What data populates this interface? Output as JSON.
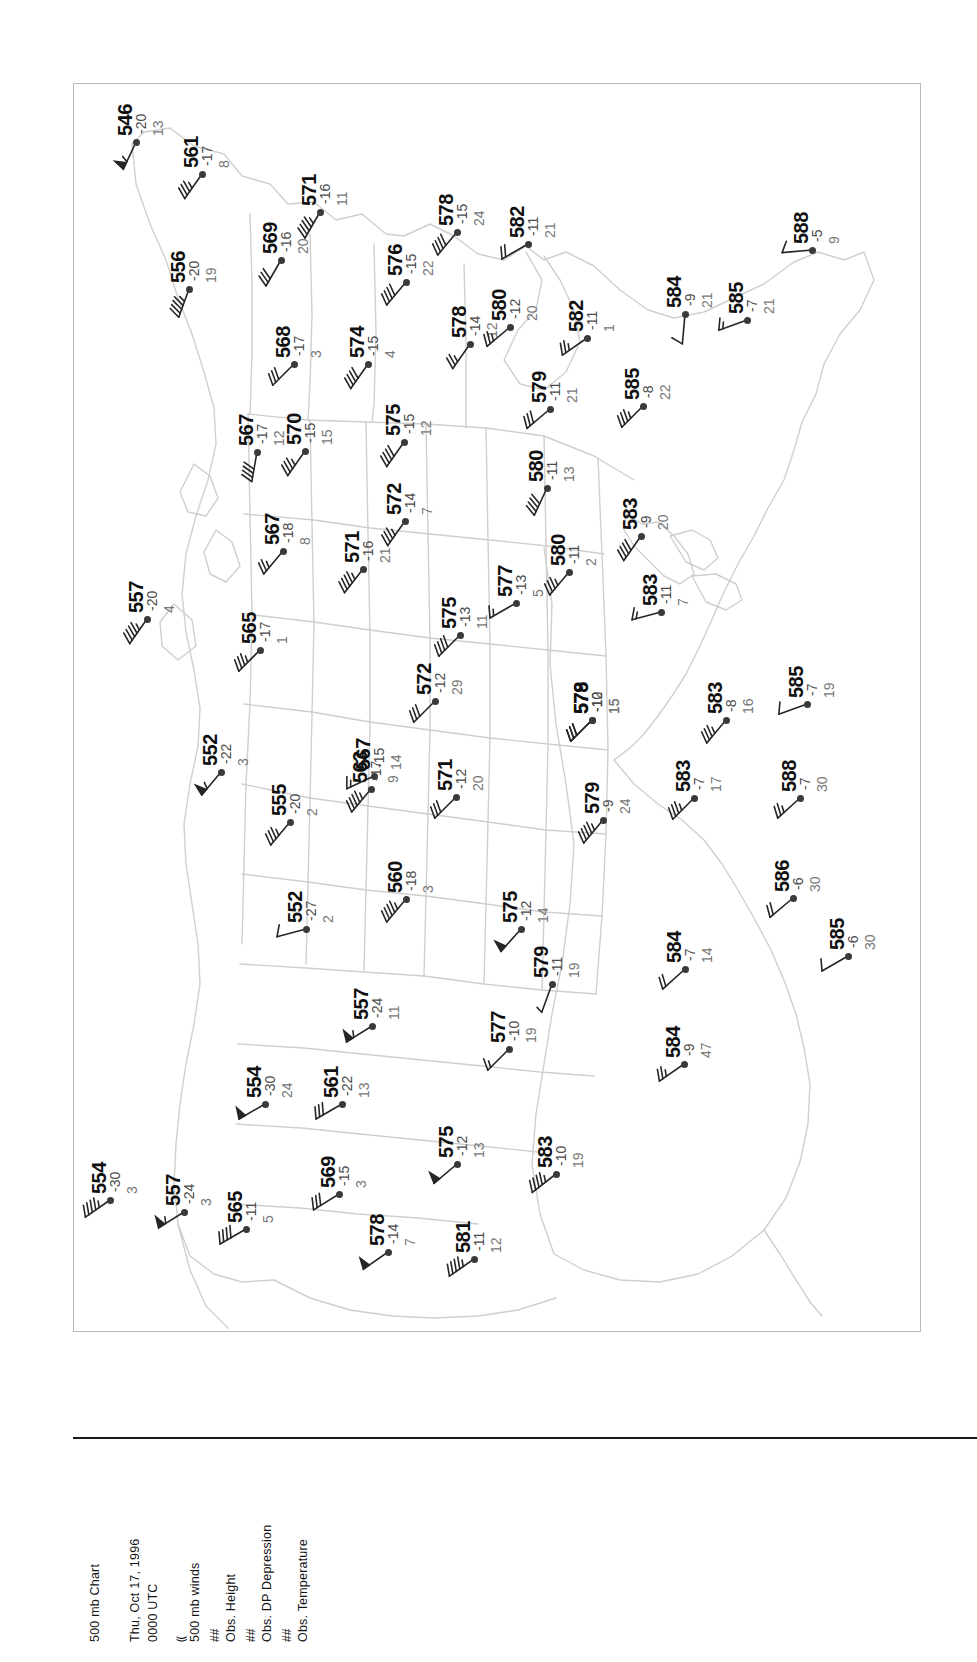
{
  "document": {
    "title_line_1": "500 mb Chart",
    "date_line": "Thu, Oct 17, 1996",
    "time_line": "0000 UTC"
  },
  "legend": {
    "wind_symbol": "⸨",
    "wind_label": "500 mb winds",
    "height_symbol": "##",
    "height_label": "Obs. Height",
    "dpd_symbol": "##",
    "dpd_label": "Obs. DP Depression",
    "temp_symbol": "##",
    "temp_label": "Obs. Temperature"
  },
  "chart_data": {
    "type": "scatter",
    "title": "500 mb Chart",
    "subtitle": "Thu, Oct 17, 1996 0000 UTC",
    "xlabel": "",
    "ylabel": "",
    "grid": false,
    "legend_position": "bottom-left",
    "projection_note": "North America, map rotated 90 degrees clockwise on page",
    "fields": [
      "height_dam",
      "temperature_C",
      "dewpoint_depression_C",
      "wind_barb_deg",
      "wind_speed_kt"
    ],
    "stations": [
      {
        "height": "546",
        "temp": "-20",
        "dpd": "13",
        "x": 62,
        "y": 58,
        "barb_rot": 205,
        "barb_kt": 55
      },
      {
        "height": "561",
        "temp": "-17",
        "dpd": "8",
        "x": 128,
        "y": 90,
        "barb_rot": 215,
        "barb_kt": 35
      },
      {
        "height": "569",
        "temp": "-16",
        "dpd": "20",
        "x": 207,
        "y": 176,
        "barb_rot": 210,
        "barb_kt": 30
      },
      {
        "height": "571",
        "temp": "-16",
        "dpd": "11",
        "x": 246,
        "y": 128,
        "barb_rot": 210,
        "barb_kt": 45
      },
      {
        "height": "556",
        "temp": "-20",
        "dpd": "19",
        "x": 115,
        "y": 205,
        "barb_rot": 200,
        "barb_kt": 45
      },
      {
        "height": "568",
        "temp": "-17",
        "dpd": "3",
        "x": 220,
        "y": 280,
        "barb_rot": 225,
        "barb_kt": 30
      },
      {
        "height": "574",
        "temp": "-15",
        "dpd": "4",
        "x": 294,
        "y": 280,
        "barb_rot": 215,
        "barb_kt": 40
      },
      {
        "height": "576",
        "temp": "-15",
        "dpd": "22",
        "x": 332,
        "y": 198,
        "barb_rot": 220,
        "barb_kt": 40
      },
      {
        "height": "578",
        "temp": "-15",
        "dpd": "24",
        "x": 383,
        "y": 148,
        "barb_rot": 220,
        "barb_kt": 40
      },
      {
        "height": "582",
        "temp": "-11",
        "dpd": "21",
        "x": 454,
        "y": 160,
        "barb_rot": 240,
        "barb_kt": 20
      },
      {
        "height": "578",
        "temp": "-14",
        "dpd": "12",
        "x": 396,
        "y": 260,
        "barb_rot": 215,
        "barb_kt": 25
      },
      {
        "height": "580",
        "temp": "-12",
        "dpd": "20",
        "x": 436,
        "y": 243,
        "barb_rot": 230,
        "barb_kt": 25
      },
      {
        "height": "582",
        "temp": "-11",
        "dpd": "1",
        "x": 513,
        "y": 254,
        "barb_rot": 235,
        "barb_kt": 25
      },
      {
        "height": "584",
        "temp": "-9",
        "dpd": "21",
        "x": 611,
        "y": 230,
        "barb_rot": 185,
        "barb_kt": 10
      },
      {
        "height": "585",
        "temp": "-7",
        "dpd": "21",
        "x": 673,
        "y": 236,
        "barb_rot": 250,
        "barb_kt": 15
      },
      {
        "height": "588",
        "temp": "-5",
        "dpd": "9",
        "x": 738,
        "y": 166,
        "barb_rot": 265,
        "barb_kt": 10
      },
      {
        "height": "570",
        "temp": "-15",
        "dpd": "15",
        "x": 231,
        "y": 367,
        "barb_rot": 215,
        "barb_kt": 35
      },
      {
        "height": "567",
        "temp": "-17",
        "dpd": "12",
        "x": 183,
        "y": 368,
        "barb_rot": 190,
        "barb_kt": 40
      },
      {
        "height": "575",
        "temp": "-15",
        "dpd": "12",
        "x": 330,
        "y": 358,
        "barb_rot": 215,
        "barb_kt": 40
      },
      {
        "height": "579",
        "temp": "-11",
        "dpd": "21",
        "x": 476,
        "y": 325,
        "barb_rot": 230,
        "barb_kt": 30
      },
      {
        "height": "585",
        "temp": "-8",
        "dpd": "22",
        "x": 569,
        "y": 322,
        "barb_rot": 225,
        "barb_kt": 35
      },
      {
        "height": "567",
        "temp": "-18",
        "dpd": "8",
        "x": 209,
        "y": 467,
        "barb_rot": 220,
        "barb_kt": 25
      },
      {
        "height": "571",
        "temp": "-16",
        "dpd": "21",
        "x": 289,
        "y": 485,
        "barb_rot": 218,
        "barb_kt": 45
      },
      {
        "height": "572",
        "temp": "-14",
        "dpd": "7",
        "x": 331,
        "y": 437,
        "barb_rot": 215,
        "barb_kt": 35
      },
      {
        "height": "580",
        "temp": "-11",
        "dpd": "13",
        "x": 473,
        "y": 404,
        "barb_rot": 205,
        "barb_kt": 40
      },
      {
        "height": "583",
        "temp": "-9",
        "dpd": "20",
        "x": 567,
        "y": 452,
        "barb_rot": 215,
        "barb_kt": 40
      },
      {
        "height": "565",
        "temp": "-17",
        "dpd": "1",
        "x": 186,
        "y": 566,
        "barb_rot": 225,
        "barb_kt": 35
      },
      {
        "height": "557",
        "temp": "-20",
        "dpd": "4",
        "x": 73,
        "y": 535,
        "barb_rot": 215,
        "barb_kt": 45
      },
      {
        "height": "577",
        "temp": "-13",
        "dpd": "5",
        "x": 442,
        "y": 519,
        "barb_rot": 240,
        "barb_kt": 15
      },
      {
        "height": "575",
        "temp": "-13",
        "dpd": "11",
        "x": 386,
        "y": 551,
        "barb_rot": 225,
        "barb_kt": 40
      },
      {
        "height": "580",
        "temp": "-11",
        "dpd": "2",
        "x": 495,
        "y": 488,
        "barb_rot": 220,
        "barb_kt": 35
      },
      {
        "height": "583",
        "temp": "-11",
        "dpd": "7",
        "x": 587,
        "y": 528,
        "barb_rot": 255,
        "barb_kt": 15
      },
      {
        "height": "567",
        "temp": "-15",
        "dpd": "14",
        "x": 300,
        "y": 692,
        "barb_rot": 245,
        "barb_kt": 15
      },
      {
        "height": "572",
        "temp": "-12",
        "dpd": "29",
        "x": 361,
        "y": 617,
        "barb_rot": 225,
        "barb_kt": 30
      },
      {
        "height": "579",
        "temp": "-12",
        "dpd": "15",
        "x": 518,
        "y": 636,
        "barb_rot": 225,
        "barb_kt": 30
      },
      {
        "height": "578",
        "temp": "-10",
        "dpd": "15",
        "x": 518,
        "y": 636,
        "barb_rot": 225,
        "barb_kt": 30
      },
      {
        "height": "583",
        "temp": "-8",
        "dpd": "16",
        "x": 652,
        "y": 636,
        "barb_rot": 220,
        "barb_kt": 35
      },
      {
        "height": "585",
        "temp": "-7",
        "dpd": "19",
        "x": 733,
        "y": 620,
        "barb_rot": 250,
        "barb_kt": 10
      },
      {
        "height": "552",
        "temp": "-22",
        "dpd": "3",
        "x": 147,
        "y": 688,
        "barb_rot": 220,
        "barb_kt": 55
      },
      {
        "height": "555",
        "temp": "-20",
        "dpd": "2",
        "x": 216,
        "y": 738,
        "barb_rot": 220,
        "barb_kt": 35
      },
      {
        "height": "563",
        "temp": "-17",
        "dpd": "9",
        "x": 297,
        "y": 705,
        "barb_rot": 220,
        "barb_kt": 45
      },
      {
        "height": "571",
        "temp": "-12",
        "dpd": "20",
        "x": 382,
        "y": 713,
        "barb_rot": 225,
        "barb_kt": 30
      },
      {
        "height": "579",
        "temp": "-9",
        "dpd": "24",
        "x": 529,
        "y": 736,
        "barb_rot": 220,
        "barb_kt": 45
      },
      {
        "height": "583",
        "temp": "-7",
        "dpd": "17",
        "x": 620,
        "y": 714,
        "barb_rot": 225,
        "barb_kt": 35
      },
      {
        "height": "588",
        "temp": "-7",
        "dpd": "30",
        "x": 726,
        "y": 714,
        "barb_rot": 228,
        "barb_kt": 25
      },
      {
        "height": "552",
        "temp": "-27",
        "dpd": "2",
        "x": 232,
        "y": 845,
        "barb_rot": 255,
        "barb_kt": 10
      },
      {
        "height": "560",
        "temp": "-18",
        "dpd": "3",
        "x": 332,
        "y": 815,
        "barb_rot": 220,
        "barb_kt": 45
      },
      {
        "height": "575",
        "temp": "-12",
        "dpd": "14",
        "x": 447,
        "y": 845,
        "barb_rot": 222,
        "barb_kt": 50
      },
      {
        "height": "579",
        "temp": "-11",
        "dpd": "19",
        "x": 478,
        "y": 900,
        "barb_rot": 200,
        "barb_kt": 5
      },
      {
        "height": "584",
        "temp": "-7",
        "dpd": "14",
        "x": 611,
        "y": 885,
        "barb_rot": 228,
        "barb_kt": 20
      },
      {
        "height": "586",
        "temp": "-6",
        "dpd": "30",
        "x": 719,
        "y": 814,
        "barb_rot": 230,
        "barb_kt": 20
      },
      {
        "height": "585",
        "temp": "-6",
        "dpd": "30",
        "x": 774,
        "y": 872,
        "barb_rot": 240,
        "barb_kt": 10
      },
      {
        "height": "554",
        "temp": "-30",
        "dpd": "24",
        "x": 191,
        "y": 1020,
        "barb_rot": 240,
        "barb_kt": 50
      },
      {
        "height": "561",
        "temp": "-22",
        "dpd": "13",
        "x": 268,
        "y": 1020,
        "barb_rot": 240,
        "barb_kt": 30
      },
      {
        "height": "557",
        "temp": "-24",
        "dpd": "11",
        "x": 298,
        "y": 942,
        "barb_rot": 238,
        "barb_kt": 55
      },
      {
        "height": "577",
        "temp": "-10",
        "dpd": "19",
        "x": 435,
        "y": 965,
        "barb_rot": 225,
        "barb_kt": 15
      },
      {
        "height": "584",
        "temp": "-9",
        "dpd": "47",
        "x": 610,
        "y": 980,
        "barb_rot": 235,
        "barb_kt": 25
      },
      {
        "height": "554",
        "temp": "-30",
        "dpd": "3",
        "x": 36,
        "y": 1116,
        "barb_rot": 235,
        "barb_kt": 45
      },
      {
        "height": "557",
        "temp": "-24",
        "dpd": "3",
        "x": 110,
        "y": 1128,
        "barb_rot": 238,
        "barb_kt": 55
      },
      {
        "height": "565",
        "temp": "-11",
        "dpd": "5",
        "x": 172,
        "y": 1145,
        "barb_rot": 240,
        "barb_kt": 40
      },
      {
        "height": "569",
        "temp": "-15",
        "dpd": "3",
        "x": 265,
        "y": 1110,
        "barb_rot": 238,
        "barb_kt": 30
      },
      {
        "height": "578",
        "temp": "-14",
        "dpd": "7",
        "x": 314,
        "y": 1168,
        "barb_rot": 235,
        "barb_kt": 50
      },
      {
        "height": "575",
        "temp": "-12",
        "dpd": "13",
        "x": 383,
        "y": 1080,
        "barb_rot": 230,
        "barb_kt": 50
      },
      {
        "height": "581",
        "temp": "-11",
        "dpd": "12",
        "x": 400,
        "y": 1175,
        "barb_rot": 235,
        "barb_kt": 45
      },
      {
        "height": "583",
        "temp": "-10",
        "dpd": "19",
        "x": 482,
        "y": 1090,
        "barb_rot": 232,
        "barb_kt": 45
      }
    ]
  }
}
